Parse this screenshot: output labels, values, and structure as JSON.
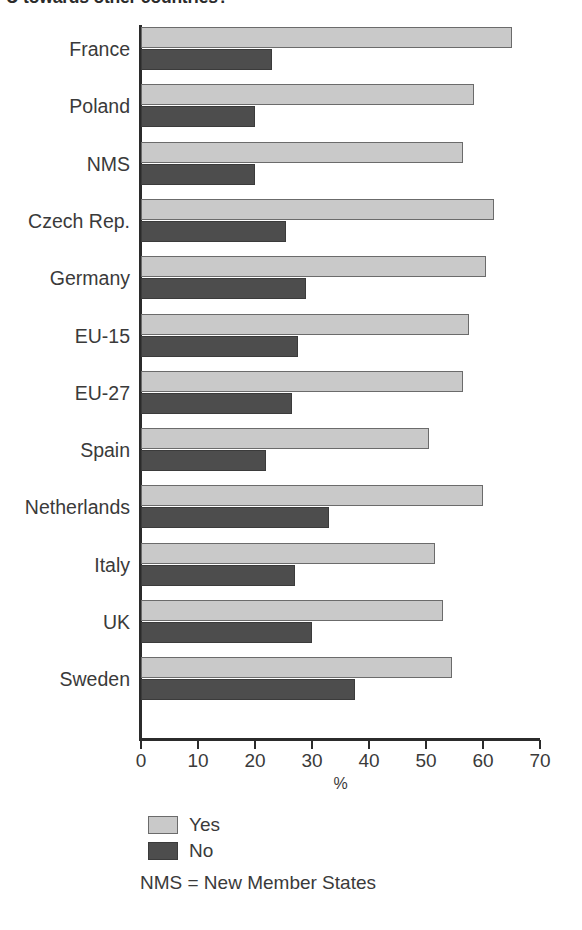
{
  "chart_data": {
    "type": "bar",
    "orientation": "horizontal",
    "title": "U towards other countries?",
    "xlabel": "%",
    "ylabel": "",
    "xlim": [
      0,
      70
    ],
    "xticks": [
      0,
      10,
      20,
      30,
      40,
      50,
      60,
      70
    ],
    "grid": false,
    "legend_position": "bottom-left",
    "note": "NMS = New Member States",
    "categories": [
      "France",
      "Poland",
      "NMS",
      "Czech Rep.",
      "Germany",
      "EU-15",
      "EU-27",
      "Spain",
      "Netherlands",
      "Italy",
      "UK",
      "Sweden"
    ],
    "series": [
      {
        "name": "Yes",
        "color": "#c9c9c9",
        "values": [
          65,
          58.5,
          56.5,
          62,
          60.5,
          57.5,
          56.5,
          50.5,
          60,
          51.5,
          53,
          54.5
        ]
      },
      {
        "name": "No",
        "color": "#4d4d4d",
        "values": [
          23,
          20,
          20,
          25.5,
          29,
          27.5,
          26.5,
          22,
          33,
          27,
          30,
          37.5
        ]
      }
    ]
  }
}
